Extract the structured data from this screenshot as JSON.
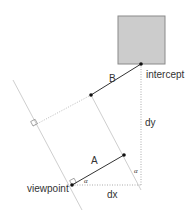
{
  "diagram": {
    "labels": {
      "intercept": "intercept",
      "viewpoint": "viewpoint",
      "segment_a": "A",
      "segment_b": "B",
      "dx": "dx",
      "dy": "dy",
      "alpha_viewpoint": "α",
      "alpha_right": "α"
    },
    "colors": {
      "box_fill": "#cccccc",
      "box_stroke": "#8a8a8a",
      "line": "#333333",
      "guide": "#bbbbbb",
      "dotted": "#aaaaaa"
    },
    "points": {
      "viewpoint": [
        72,
        185
      ],
      "intercept": [
        141,
        64
      ],
      "a_end": [
        124,
        155
      ],
      "b_start": [
        91,
        95
      ],
      "corner": [
        141,
        185
      ]
    }
  }
}
